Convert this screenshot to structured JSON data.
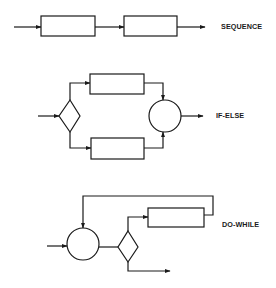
{
  "diagram": {
    "constructs": [
      {
        "id": "sequence",
        "label": "SEQUENCE",
        "nodes": [
          "process-box-1",
          "process-box-2"
        ],
        "flow": [
          "input -> process-box-1",
          "process-box-1 -> process-box-2",
          "process-box-2 -> output"
        ]
      },
      {
        "id": "if-else",
        "label": "IF-ELSE",
        "nodes": [
          "decision-diamond",
          "process-box-true",
          "process-box-false",
          "junction-circle"
        ],
        "flow": [
          "input -> decision-diamond",
          "decision-diamond -> process-box-true",
          "decision-diamond -> process-box-false",
          "process-box-true -> junction-circle",
          "process-box-false -> junction-circle",
          "junction-circle -> output"
        ]
      },
      {
        "id": "do-while",
        "label": "DO-WHILE",
        "nodes": [
          "junction-circle",
          "decision-diamond",
          "process-box"
        ],
        "flow": [
          "input -> junction-circle",
          "junction-circle -> decision-diamond",
          "decision-diamond -> process-box",
          "process-box -> junction-circle (loop back)",
          "decision-diamond -> output"
        ]
      }
    ],
    "colors": {
      "line": "#1a1a1a",
      "background": "#ffffff"
    }
  }
}
